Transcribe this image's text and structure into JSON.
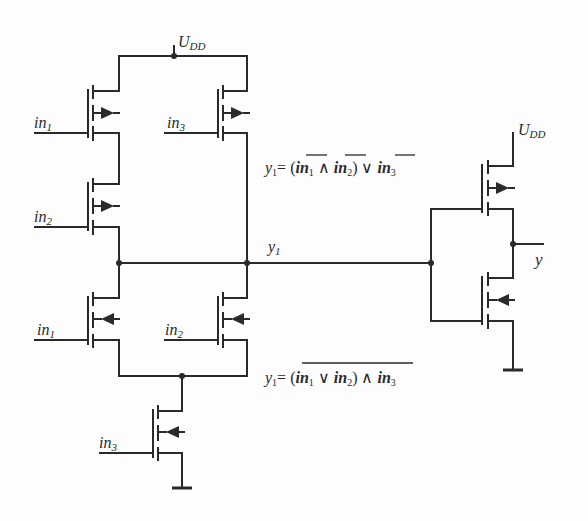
{
  "diagram": {
    "type": "CMOS circuit schematic",
    "supply_label": "U",
    "supply_sub": "DD",
    "node_label": "y",
    "node_sub": "1",
    "output_label": "y",
    "inputs": {
      "in1_base": "in",
      "in1_sub": "1",
      "in2_base": "in",
      "in2_sub": "2",
      "in3_base": "in",
      "in3_sub": "3"
    },
    "equation_top": {
      "lhs": "y",
      "lhs_sub": "1",
      "text": "= (in₁ ∧ in₂) ∨ in₃",
      "parts": [
        "= (",
        "in",
        "1",
        " ∧ ",
        "in",
        "2",
        ") ∨ ",
        "in",
        "3"
      ],
      "note": "each input individually negated (overbar on in1, in2, in3)"
    },
    "equation_bottom": {
      "lhs": "y",
      "lhs_sub": "1",
      "text": "= (in₁ ∨ in₂) ∧ in₃",
      "parts": [
        "= (",
        "in",
        "1",
        " ∨ ",
        "in",
        "2",
        ") ∧ ",
        "in",
        "3"
      ],
      "note": "whole expression negated (single overbar)"
    },
    "transistors": [
      {
        "id": "P1",
        "type": "PMOS",
        "gate": "in1",
        "position": "pull-up left top"
      },
      {
        "id": "P2",
        "type": "PMOS",
        "gate": "in2",
        "position": "pull-up left bottom"
      },
      {
        "id": "P3",
        "type": "PMOS",
        "gate": "in3",
        "position": "pull-up right"
      },
      {
        "id": "N1",
        "type": "NMOS",
        "gate": "in1",
        "position": "pull-down left"
      },
      {
        "id": "N2",
        "type": "NMOS",
        "gate": "in2",
        "position": "pull-down right"
      },
      {
        "id": "N3",
        "type": "NMOS",
        "gate": "in3",
        "position": "pull-down series"
      },
      {
        "id": "P4",
        "type": "PMOS",
        "gate": "y1",
        "position": "inverter pull-up"
      },
      {
        "id": "N4",
        "type": "NMOS",
        "gate": "y1",
        "position": "inverter pull-down"
      }
    ],
    "colors": {
      "line": "#2a2a2a",
      "background": "#fdfdfd"
    }
  }
}
